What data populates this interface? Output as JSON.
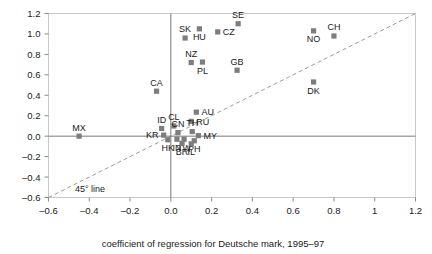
{
  "chart_data": {
    "type": "scatter",
    "title": "",
    "xlabel": "coefficient of regression for Deutsche mark, 1995–97",
    "ylabel": "",
    "xlim": [
      -0.6,
      1.2
    ],
    "ylim": [
      -0.6,
      1.2
    ],
    "xticks": [
      -0.6,
      -0.4,
      -0.2,
      0.0,
      0.2,
      0.4,
      0.6,
      0.8,
      1.0,
      1.2
    ],
    "xticklabels": [
      "–0.6",
      "–0.4",
      "–0.2",
      "0.0",
      "0.2",
      "0.4",
      "0.6",
      "0.8",
      "1",
      "1.2"
    ],
    "yticks": [
      -0.6,
      -0.4,
      -0.2,
      0.0,
      0.2,
      0.4,
      0.6,
      0.8,
      1.0,
      1.2
    ],
    "yticklabels": [
      "–0.6",
      "–0.4",
      "–0.2",
      "0.0",
      "0.2",
      "0.4",
      "0.6",
      "0.8",
      "1.0",
      "1.2"
    ],
    "grid": false,
    "zero_lines": true,
    "marker_color": "#7d7d7d",
    "marker_shape": "square",
    "annotations": [
      {
        "text": "45° line",
        "x": -0.47,
        "y": -0.55
      }
    ],
    "reference_lines": [
      {
        "name": "45-degree-line",
        "style": "dashed",
        "from": [
          -0.6,
          -0.6
        ],
        "to": [
          1.2,
          1.2
        ],
        "color": "#9a9a9a"
      }
    ],
    "points": [
      {
        "label": "MX",
        "x": -0.45,
        "y": 0.0,
        "label_pos": "above"
      },
      {
        "label": "CA",
        "x": -0.07,
        "y": 0.44,
        "label_pos": "above"
      },
      {
        "label": "SK",
        "x": 0.07,
        "y": 0.96,
        "label_pos": "above"
      },
      {
        "label": "HU",
        "x": 0.14,
        "y": 1.05,
        "label_pos": "below"
      },
      {
        "label": "CZ",
        "x": 0.23,
        "y": 1.02,
        "label_pos": "right"
      },
      {
        "label": "SE",
        "x": 0.33,
        "y": 1.1,
        "label_pos": "above"
      },
      {
        "label": "NO",
        "x": 0.7,
        "y": 1.03,
        "label_pos": "below"
      },
      {
        "label": "CH",
        "x": 0.8,
        "y": 0.98,
        "label_pos": "above"
      },
      {
        "label": "NZ",
        "x": 0.1,
        "y": 0.72,
        "label_pos": "above"
      },
      {
        "label": "PL",
        "x": 0.155,
        "y": 0.725,
        "label_pos": "below"
      },
      {
        "label": "GB",
        "x": 0.325,
        "y": 0.645,
        "label_pos": "above"
      },
      {
        "label": "DK",
        "x": 0.7,
        "y": 0.53,
        "label_pos": "below"
      },
      {
        "label": "AU",
        "x": 0.125,
        "y": 0.235,
        "label_pos": "right"
      },
      {
        "label": "RU",
        "x": 0.1,
        "y": 0.145,
        "label_pos": "right"
      },
      {
        "label": "CL",
        "x": 0.015,
        "y": 0.1,
        "label_pos": "above"
      },
      {
        "label": "ID",
        "x": -0.045,
        "y": 0.075,
        "label_pos": "above"
      },
      {
        "label": "CN",
        "x": 0.035,
        "y": 0.035,
        "label_pos": "above"
      },
      {
        "label": "TH",
        "x": 0.105,
        "y": 0.045,
        "label_pos": "above"
      },
      {
        "label": "KR",
        "x": -0.035,
        "y": 0.01,
        "label_pos": "left"
      },
      {
        "label": "MY",
        "x": 0.135,
        "y": 0.005,
        "label_pos": "right"
      },
      {
        "label": "HK",
        "x": -0.015,
        "y": -0.035,
        "label_pos": "below"
      },
      {
        "label": "IN",
        "x": 0.03,
        "y": -0.03,
        "label_pos": "below"
      },
      {
        "label": "TW",
        "x": 0.065,
        "y": -0.03,
        "label_pos": "below"
      },
      {
        "label": "PH",
        "x": 0.115,
        "y": -0.045,
        "label_pos": "below"
      },
      {
        "label": "BR",
        "x": 0.055,
        "y": -0.07,
        "label_pos": "below"
      },
      {
        "label": "IL",
        "x": 0.1,
        "y": -0.075,
        "label_pos": "below"
      }
    ]
  }
}
